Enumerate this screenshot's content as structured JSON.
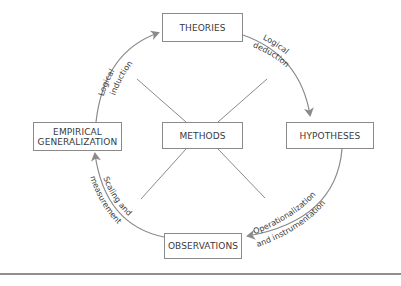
{
  "diagram": {
    "nodes": {
      "theories": {
        "label": "THEORIES"
      },
      "hypotheses": {
        "label": "HYPOTHESES"
      },
      "observations": {
        "label": "OBSERVATIONS"
      },
      "empirical_generalization": {
        "label": "EMPIRICAL\nGENERALIZATION"
      },
      "methods": {
        "label": "METHODS"
      }
    },
    "edges": {
      "logical_induction": {
        "line1": "Logical",
        "line2": "induction",
        "from": "EMPIRICAL GENERALIZATION",
        "to": "THEORIES"
      },
      "logical_deduction": {
        "line1": "Logical",
        "line2": "deduction",
        "from": "THEORIES",
        "to": "HYPOTHESES"
      },
      "operationalization": {
        "line1": "Operationalization",
        "line2": "and instrumentation",
        "from": "HYPOTHESES",
        "to": "OBSERVATIONS"
      },
      "scaling_measurement": {
        "line1": "Scaling and",
        "line2": "measurement",
        "from": "OBSERVATIONS",
        "to": "EMPIRICAL GENERALIZATION"
      }
    },
    "colors": {
      "arrow": "#8a8a8a",
      "box_border": "#8a8a8a",
      "text": "#3a3a3a",
      "rule": "#8f8f8f"
    }
  }
}
